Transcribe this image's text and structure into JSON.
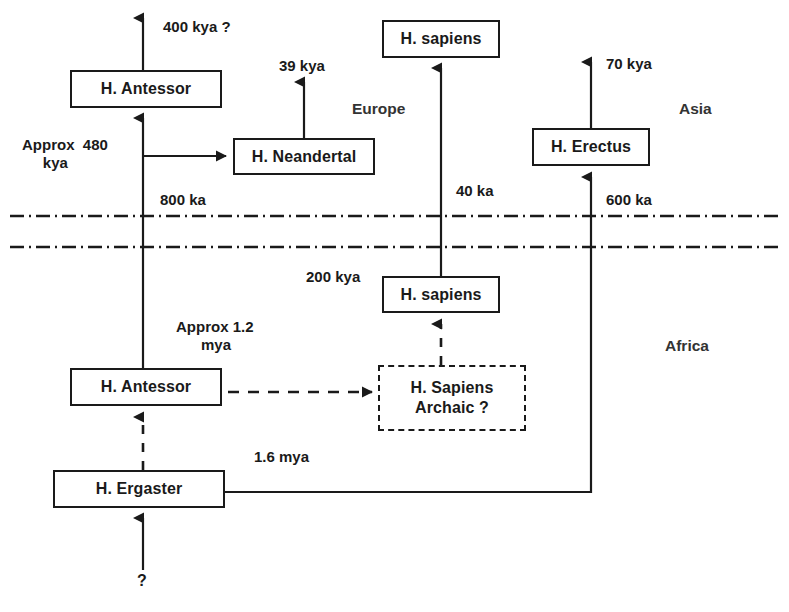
{
  "diagram": {
    "stroke_color": "#1a1a1a",
    "background": "#ffffff",
    "nodes": [
      {
        "id": "antessor_europe",
        "label": "H. Antessor",
        "style": "solid"
      },
      {
        "id": "neandertal",
        "label": "H. Neandertal",
        "style": "solid"
      },
      {
        "id": "sapiens_europe",
        "label": "H. sapiens",
        "style": "solid"
      },
      {
        "id": "erectus_asia",
        "label": "H. Erectus",
        "style": "solid"
      },
      {
        "id": "sapiens_africa",
        "label": "H. sapiens",
        "style": "solid"
      },
      {
        "id": "sapiens_archaic",
        "label_line1": "H. Sapiens",
        "label_line2": "Archaic  ?",
        "style": "dashed"
      },
      {
        "id": "antessor_africa",
        "label": "H. Antessor",
        "style": "solid"
      },
      {
        "id": "ergaster",
        "label": "H. Ergaster",
        "style": "solid"
      }
    ],
    "edge_labels": {
      "antessor_out": "400 kya ?",
      "neandertal_out": "39 kya",
      "antessor_split": "Approx  480\n     kya",
      "antessor_migration": "800 ka",
      "sapiens_migration": "40 ka",
      "erectus_out": "70 kya",
      "erectus_migration": "600 ka",
      "sapiens_africa_origin": "200 kya",
      "antessor_africa_origin": "Approx 1.2\n      mya",
      "ergaster_to_asia": "1.6 mya",
      "ergaster_origin": "?"
    },
    "region_labels": {
      "europe": "Europe",
      "asia": "Asia",
      "africa": "Africa"
    }
  }
}
